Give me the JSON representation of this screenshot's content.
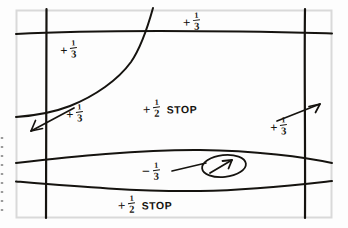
{
  "document": {
    "kind": "hand-drawn-sketch",
    "subject": "exposure-compensation-zone-map",
    "background_color": "#fdfdfd",
    "ink_color": "#15130f",
    "frame_color": "#d7d7d7"
  },
  "annotations": [
    {
      "id": "top",
      "sign": "+",
      "numerator": "1",
      "denominator": "3",
      "stop_label": "",
      "value": 0.3333,
      "position": {
        "x": 183,
        "y": 13
      }
    },
    {
      "id": "upper-left",
      "sign": "+",
      "numerator": "1",
      "denominator": "3",
      "stop_label": "",
      "value": 0.3333,
      "position": {
        "x": 60,
        "y": 41
      }
    },
    {
      "id": "center",
      "sign": "+",
      "numerator": "1",
      "denominator": "2",
      "stop_label": "STOP",
      "value": 0.5,
      "position": {
        "x": 143,
        "y": 100
      }
    },
    {
      "id": "left",
      "sign": "+",
      "numerator": "1",
      "denominator": "3",
      "stop_label": "",
      "value": 0.3333,
      "position": {
        "x": 66,
        "y": 105
      }
    },
    {
      "id": "right",
      "sign": "+",
      "numerator": "1",
      "denominator": "3",
      "stop_label": "",
      "value": 0.3333,
      "position": {
        "x": 270,
        "y": 118
      }
    },
    {
      "id": "negative",
      "sign": "−",
      "numerator": "1",
      "denominator": "3",
      "stop_label": "",
      "value": -0.3333,
      "position": {
        "x": 142,
        "y": 163
      }
    },
    {
      "id": "bottom",
      "sign": "+",
      "numerator": "1",
      "denominator": "2",
      "stop_label": "STOP",
      "value": 0.5,
      "position": {
        "x": 118,
        "y": 196
      }
    }
  ],
  "strokes": {
    "frame": "M16,10 L332,10 L332,218 L16,218 Z",
    "vertical_left": "M46.5,9 C45.8,60 46.4,130 46.0,218",
    "vertical_right": "M305,9 C304.2,60 305.4,140 305.0,218",
    "horizontal_top": "M16,34 C70,31 160,30.5 240,31.5 C285,32 315,33 332,33.5",
    "horizontal_mid": "M16,163 C70,157 140,149.5 200,150 C255,150.5 305,157 332,163",
    "horizontal_low": "M16,181.5 C70,186 140,192 200,191 C255,190 305,184 332,181",
    "curve_diagonal": "M153,8 C148,26 142,46 131,62 C118,80 95,96 70,106 C52,113 30,116 16,117",
    "arrow_left_shaft": "M74,108 L31,131",
    "arrow_left_head": "M31,131 L41,128 M31,131 L35,121",
    "arrow_right_shaft": "M277,120 L320,104",
    "arrow_right_head": "M320,104 L310,106 M320,104 L315,112",
    "leader_neg": "M172,170 L205,163",
    "ellipse": {
      "cx": 224,
      "cy": 166,
      "rx": 22,
      "ry": 11,
      "rotation": -6
    },
    "ellipse_arrow_shaft": "M209,173 L231,160",
    "ellipse_arrow_head": "M231,160 L222,161 M231,160 L228,168",
    "edge_artifact_dots": "M2,136 L2,212"
  }
}
